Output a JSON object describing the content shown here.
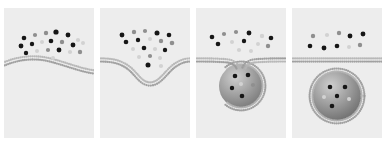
{
  "figure": {
    "background_color": "#ffffff",
    "panel_background_color": "#ededed",
    "width": 384,
    "height": 147,
    "panel_count": 4
  },
  "palette": {
    "particle_dark": "#141414",
    "particle_mid": "#8f8f8f",
    "particle_light": "#d2d2d2",
    "membrane_bead": "#b4b4b4",
    "membrane_bead_dark": "#9a9a9a",
    "vesicle_fill_light": "#c9c9c9",
    "vesicle_fill_dark": "#6d6d6d",
    "panel_bg": "#ededed"
  },
  "geometry": {
    "panel_width": 90,
    "panel_height": 130,
    "panel_top": 8,
    "panel_lefts": [
      4,
      100,
      196,
      292
    ],
    "membrane_thickness": 5,
    "bead_radius": 1.15,
    "bead_spacing": 1.95
  },
  "panels": [
    {
      "id": "panel-flat-membrane",
      "index": 0,
      "stage_label": "flat membrane with cargo particles",
      "membrane": {
        "type": "gentle-wave",
        "path": "M 0 56 C 14 50 30 48 46 52 C 62 56 76 62 90 64",
        "curvature": "shallow upward bow"
      },
      "vesicle": null,
      "particles": [
        {
          "x": 20,
          "y": 30,
          "r": 2.3,
          "shade": "dark"
        },
        {
          "x": 31,
          "y": 27,
          "r": 2.1,
          "shade": "mid"
        },
        {
          "x": 42,
          "y": 25,
          "r": 2.2,
          "shade": "mid"
        },
        {
          "x": 52,
          "y": 24,
          "r": 2.6,
          "shade": "dark"
        },
        {
          "x": 64,
          "y": 27,
          "r": 2.4,
          "shade": "dark"
        },
        {
          "x": 74,
          "y": 32,
          "r": 2.1,
          "shade": "light"
        },
        {
          "x": 17,
          "y": 38,
          "r": 2.4,
          "shade": "dark"
        },
        {
          "x": 28,
          "y": 36,
          "r": 2.2,
          "shade": "dark"
        },
        {
          "x": 38,
          "y": 34,
          "r": 2.0,
          "shade": "light"
        },
        {
          "x": 47,
          "y": 33,
          "r": 2.3,
          "shade": "dark"
        },
        {
          "x": 58,
          "y": 34,
          "r": 2.2,
          "shade": "mid"
        },
        {
          "x": 69,
          "y": 37,
          "r": 2.4,
          "shade": "dark"
        },
        {
          "x": 79,
          "y": 35,
          "r": 2.0,
          "shade": "light"
        },
        {
          "x": 22,
          "y": 45,
          "r": 2.2,
          "shade": "dark"
        },
        {
          "x": 33,
          "y": 43,
          "r": 2.0,
          "shade": "light"
        },
        {
          "x": 44,
          "y": 42,
          "r": 2.1,
          "shade": "mid"
        },
        {
          "x": 55,
          "y": 42,
          "r": 2.4,
          "shade": "dark"
        },
        {
          "x": 66,
          "y": 44,
          "r": 2.1,
          "shade": "light"
        },
        {
          "x": 76,
          "y": 44,
          "r": 2.2,
          "shade": "mid"
        },
        {
          "x": 49,
          "y": 50,
          "r": 2.0,
          "shade": "light"
        }
      ]
    },
    {
      "id": "panel-invagination",
      "index": 1,
      "stage_label": "membrane invagination forming shallow pit",
      "membrane": {
        "type": "u-dip",
        "path": "M 0 52 C 10 52 18 53 26 58 C 36 64 40 76 50 76 C 60 76 66 64 74 58 C 81 53 86 52 90 52",
        "curvature": "deep U-shaped dip centered at x=50"
      },
      "vesicle": null,
      "particles": [
        {
          "x": 22,
          "y": 27,
          "r": 2.4,
          "shade": "dark"
        },
        {
          "x": 34,
          "y": 24,
          "r": 2.2,
          "shade": "mid"
        },
        {
          "x": 45,
          "y": 23,
          "r": 2.1,
          "shade": "mid"
        },
        {
          "x": 57,
          "y": 25,
          "r": 2.5,
          "shade": "dark"
        },
        {
          "x": 69,
          "y": 27,
          "r": 2.3,
          "shade": "dark"
        },
        {
          "x": 26,
          "y": 34,
          "r": 2.3,
          "shade": "dark"
        },
        {
          "x": 38,
          "y": 32,
          "r": 2.2,
          "shade": "dark"
        },
        {
          "x": 50,
          "y": 31,
          "r": 2.0,
          "shade": "light"
        },
        {
          "x": 61,
          "y": 33,
          "r": 2.2,
          "shade": "mid"
        },
        {
          "x": 72,
          "y": 35,
          "r": 2.3,
          "shade": "mid"
        },
        {
          "x": 33,
          "y": 41,
          "r": 2.0,
          "shade": "light"
        },
        {
          "x": 44,
          "y": 40,
          "r": 2.3,
          "shade": "dark"
        },
        {
          "x": 55,
          "y": 41,
          "r": 2.1,
          "shade": "light"
        },
        {
          "x": 65,
          "y": 42,
          "r": 2.2,
          "shade": "dark"
        },
        {
          "x": 39,
          "y": 49,
          "r": 2.0,
          "shade": "light"
        },
        {
          "x": 50,
          "y": 48,
          "r": 2.1,
          "shade": "mid"
        },
        {
          "x": 60,
          "y": 50,
          "r": 2.0,
          "shade": "light"
        },
        {
          "x": 48,
          "y": 57,
          "r": 2.5,
          "shade": "dark"
        },
        {
          "x": 61,
          "y": 58,
          "r": 2.1,
          "shade": "light"
        }
      ]
    },
    {
      "id": "panel-budding-neck",
      "index": 2,
      "stage_label": "deep bud with narrow neck about to pinch off",
      "membrane": {
        "type": "neck-bud",
        "path": "M 0 52 C 10 52 22 52 32 53 C 38 54 41 57 42 60 M 90 52 C 80 52 68 52 58 53 C 52 54 49 57 48 60",
        "curvature": "flat membrane narrowing into neck at x=45"
      },
      "vesicle": {
        "cx": 45,
        "cy": 78,
        "r": 24,
        "shell": "radial bead corona",
        "fill_gradient": [
          "#cfcfcf",
          "#6d6d6d"
        ],
        "attached": true
      },
      "particles": [
        {
          "x": 16,
          "y": 29,
          "r": 2.3,
          "shade": "dark"
        },
        {
          "x": 28,
          "y": 26,
          "r": 2.1,
          "shade": "mid"
        },
        {
          "x": 40,
          "y": 24,
          "r": 2.1,
          "shade": "mid"
        },
        {
          "x": 53,
          "y": 25,
          "r": 2.4,
          "shade": "dark"
        },
        {
          "x": 66,
          "y": 28,
          "r": 2.2,
          "shade": "light"
        },
        {
          "x": 75,
          "y": 30,
          "r": 2.3,
          "shade": "dark"
        },
        {
          "x": 22,
          "y": 36,
          "r": 2.3,
          "shade": "dark"
        },
        {
          "x": 36,
          "y": 34,
          "r": 2.0,
          "shade": "light"
        },
        {
          "x": 48,
          "y": 33,
          "r": 2.2,
          "shade": "dark"
        },
        {
          "x": 62,
          "y": 36,
          "r": 2.0,
          "shade": "light"
        },
        {
          "x": 72,
          "y": 38,
          "r": 2.2,
          "shade": "mid"
        },
        {
          "x": 43,
          "y": 42,
          "r": 2.1,
          "shade": "light"
        },
        {
          "x": 55,
          "y": 43,
          "r": 2.0,
          "shade": "light"
        }
      ],
      "cargo_particles": [
        {
          "x": 39,
          "y": 68,
          "r": 2.3,
          "shade": "dark"
        },
        {
          "x": 52,
          "y": 67,
          "r": 2.3,
          "shade": "dark"
        },
        {
          "x": 45,
          "y": 76,
          "r": 2.0,
          "shade": "light"
        },
        {
          "x": 57,
          "y": 77,
          "r": 2.1,
          "shade": "mid"
        },
        {
          "x": 36,
          "y": 80,
          "r": 2.2,
          "shade": "dark"
        },
        {
          "x": 46,
          "y": 88,
          "r": 2.3,
          "shade": "dark"
        }
      ]
    },
    {
      "id": "panel-released-vesicle",
      "index": 3,
      "stage_label": "fully detached spherical vesicle below membrane",
      "membrane": {
        "type": "flat",
        "path": "M 0 52 L 90 52",
        "curvature": "straight horizontal bilayer"
      },
      "vesicle": {
        "cx": 45,
        "cy": 88,
        "r": 27,
        "shell": "closed radial bead corona",
        "fill_gradient": [
          "#cfcfcf",
          "#5f5f5f"
        ],
        "attached": false
      },
      "particles": [
        {
          "x": 21,
          "y": 28,
          "r": 2.2,
          "shade": "mid"
        },
        {
          "x": 35,
          "y": 27,
          "r": 2.1,
          "shade": "light"
        },
        {
          "x": 47,
          "y": 25,
          "r": 2.2,
          "shade": "mid"
        },
        {
          "x": 58,
          "y": 28,
          "r": 2.4,
          "shade": "dark"
        },
        {
          "x": 71,
          "y": 26,
          "r": 2.4,
          "shade": "dark"
        },
        {
          "x": 18,
          "y": 38,
          "r": 2.3,
          "shade": "dark"
        },
        {
          "x": 32,
          "y": 40,
          "r": 2.4,
          "shade": "dark"
        },
        {
          "x": 45,
          "y": 38,
          "r": 2.3,
          "shade": "dark"
        },
        {
          "x": 57,
          "y": 39,
          "r": 2.0,
          "shade": "light"
        },
        {
          "x": 68,
          "y": 37,
          "r": 2.2,
          "shade": "mid"
        }
      ],
      "cargo_particles": [
        {
          "x": 38,
          "y": 79,
          "r": 2.3,
          "shade": "dark"
        },
        {
          "x": 53,
          "y": 79,
          "r": 2.3,
          "shade": "dark"
        },
        {
          "x": 32,
          "y": 89,
          "r": 2.0,
          "shade": "light"
        },
        {
          "x": 45,
          "y": 88,
          "r": 2.2,
          "shade": "dark"
        },
        {
          "x": 57,
          "y": 91,
          "r": 2.0,
          "shade": "light"
        },
        {
          "x": 40,
          "y": 98,
          "r": 2.3,
          "shade": "dark"
        }
      ]
    }
  ]
}
